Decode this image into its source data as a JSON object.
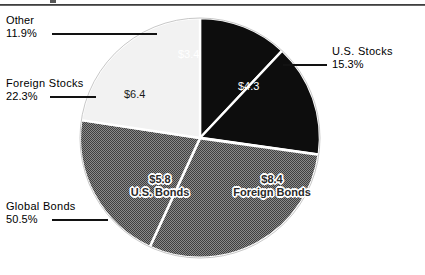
{
  "chart_data": {
    "type": "pie",
    "title": "",
    "legend_position": "callouts",
    "grid": false,
    "value_prefix": "$",
    "categories": [
      "Other",
      "U.S. Stocks",
      "Foreign Bonds",
      "U.S. Bonds",
      "Foreign Stocks"
    ],
    "values": [
      3.4,
      4.3,
      8.4,
      5.8,
      6.4
    ],
    "percent_labels": [
      "11.9%",
      "15.3%",
      "",
      "",
      "22.3%"
    ],
    "grouped_percent": {
      "Global Bonds": "50.5%"
    },
    "slices": [
      {
        "name": "Other",
        "value": 3.4,
        "value_label": "$3.4",
        "percent": "11.9%",
        "percent_value": 11.9,
        "color": "#0d0d0d",
        "text_color": "#ffffff"
      },
      {
        "name": "U.S. Stocks",
        "value": 4.3,
        "value_label": "$4.3",
        "percent": "15.3%",
        "percent_value": 15.3,
        "color": "#0d0d0d",
        "text_color": "#ffffff"
      },
      {
        "name": "Foreign Bonds",
        "value": 8.4,
        "value_label": "$8.4",
        "percent": "",
        "percent_value": 29.9,
        "color": "#6e6e6e",
        "text_color": "#2a2a2a"
      },
      {
        "name": "U.S. Bonds",
        "value": 5.8,
        "value_label": "$5.8",
        "percent": "",
        "percent_value": 20.6,
        "color": "#6e6e6e",
        "text_color": "#2a2a2a"
      },
      {
        "name": "Foreign Stocks",
        "value": 6.4,
        "value_label": "$6.4",
        "percent": "22.3%",
        "percent_value": 22.3,
        "color": "#f2f2f2",
        "text_color": "#1a1a1a"
      }
    ]
  },
  "callouts": {
    "other": {
      "name": "Other",
      "percent": "11.9%"
    },
    "foreign_stocks": {
      "name": "Foreign  Stocks",
      "percent": "22.3%"
    },
    "global_bonds": {
      "name": "Global  Bonds",
      "percent": "50.5%"
    },
    "us_stocks": {
      "name": "U.S.  Stocks",
      "percent": "15.3%"
    }
  },
  "pie_labels": {
    "other_value": "$3.4",
    "us_stocks_value": "$4.3",
    "foreign_stocks_value": "$6.4",
    "us_bonds_value": "$5.8",
    "us_bonds_name": "U.S. Bonds",
    "foreign_bonds_value": "$8.4",
    "foreign_bonds_name": "Foreign Bonds"
  },
  "colors": {
    "dark_slice": "#0d0d0d",
    "gray_slice": "#6e6e6e",
    "light_slice": "#f2f2f2",
    "separator": "#ffffff",
    "leader_line": "#121212",
    "rule": "#2b2b2b"
  }
}
